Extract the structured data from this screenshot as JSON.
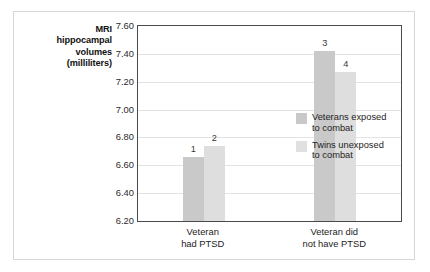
{
  "chart_data": {
    "type": "bar",
    "title": "MRI hippocampal volumes (milliliters)",
    "title_lines": [
      "MRI",
      "hippocampal",
      "volumes",
      "(milliliters)"
    ],
    "xlabel": "",
    "ylabel": "MRI hippocampal volumes (milliliters)",
    "ylim": [
      6.2,
      7.6
    ],
    "ytick_step": 0.2,
    "ytick_labels": [
      "7.60",
      "7.40",
      "7.20",
      "7.00",
      "6.80",
      "6.60",
      "6.40",
      "6.20"
    ],
    "ytick_values": [
      7.6,
      7.4,
      7.2,
      7.0,
      6.8,
      6.6,
      6.4,
      6.2
    ],
    "grid": true,
    "legend_position": "right-inside",
    "categories": [
      "Veteran had PTSD",
      "Veteran did not have PTSD"
    ],
    "category_lines": [
      [
        "Veteran",
        "had PTSD"
      ],
      [
        "Veteran did",
        "not have PTSD"
      ]
    ],
    "series": [
      {
        "name": "Veterans exposed to combat",
        "color": "#c9c9c9",
        "values": [
          6.66,
          7.42
        ],
        "point_labels": [
          "1",
          "3"
        ]
      },
      {
        "name": "Twins unexposed to combat",
        "color": "#dedede",
        "values": [
          6.74,
          7.27
        ],
        "point_labels": [
          "2",
          "4"
        ]
      }
    ],
    "legend": [
      {
        "label_lines": [
          "Veterans exposed",
          "to combat"
        ],
        "label": "Veterans exposed to combat",
        "color": "#c9c9c9"
      },
      {
        "label_lines": [
          "Twins unexposed",
          "to combat"
        ],
        "label": "Twins unexposed to combat",
        "color": "#e0e0e0"
      }
    ]
  }
}
